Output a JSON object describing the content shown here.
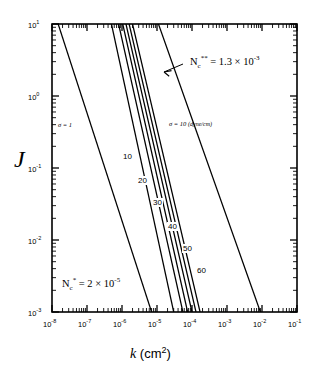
{
  "chart_data": {
    "type": "line",
    "title": "",
    "xlabel": "k  (cm2)",
    "xlabel_symbol": "k",
    "xlabel_unit": "(cm",
    "xlabel_unit_sup": "2",
    "xlabel_unit_end": ")",
    "ylabel": "J",
    "xscale": "log",
    "yscale": "log",
    "xlim": [
      1e-08,
      0.1
    ],
    "ylim": [
      0.001,
      10.0
    ],
    "grid": false,
    "legend": "none",
    "xticks": [
      {
        "value": 1e-08,
        "mantissa": "10",
        "exp": "-8"
      },
      {
        "value": 1e-07,
        "mantissa": "10",
        "exp": "-7"
      },
      {
        "value": 1e-06,
        "mantissa": "10",
        "exp": "-6"
      },
      {
        "value": 1e-05,
        "mantissa": "10",
        "exp": "-5"
      },
      {
        "value": 0.0001,
        "mantissa": "10",
        "exp": "-4"
      },
      {
        "value": 0.001,
        "mantissa": "10",
        "exp": "-3"
      },
      {
        "value": 0.01,
        "mantissa": "10",
        "exp": "-2"
      },
      {
        "value": 0.1,
        "mantissa": "10",
        "exp": "-1"
      }
    ],
    "yticks": [
      {
        "value": 10,
        "mantissa": "10",
        "exp": "1"
      },
      {
        "value": 1,
        "mantissa": "10",
        "exp": "0"
      },
      {
        "value": 0.1,
        "mantissa": "10",
        "exp": "-1"
      },
      {
        "value": 0.01,
        "mantissa": "10",
        "exp": "-2"
      },
      {
        "value": 0.001,
        "mantissa": "10",
        "exp": "-3"
      }
    ],
    "series": [
      {
        "name": "sigma-1",
        "sigma": 1,
        "label": "1",
        "x": [
          1.5e-08,
          7e-06
        ],
        "y": [
          10.0,
          0.001
        ]
      },
      {
        "name": "sigma-10",
        "sigma": 10,
        "label": "10",
        "x": [
          5e-07,
          3e-05
        ],
        "y": [
          10.0,
          0.001
        ]
      },
      {
        "name": "sigma-20",
        "sigma": 20,
        "label": "20",
        "x": [
          8e-07,
          5.5e-05
        ],
        "y": [
          10.0,
          0.001
        ]
      },
      {
        "name": "sigma-30",
        "sigma": 30,
        "label": "30",
        "x": [
          1.05e-06,
          7.5e-05
        ],
        "y": [
          10.0,
          0.001
        ]
      },
      {
        "name": "sigma-40",
        "sigma": 40,
        "label": "40",
        "x": [
          1.3e-06,
          0.0001
        ],
        "y": [
          10.0,
          0.001
        ]
      },
      {
        "name": "sigma-50",
        "sigma": 50,
        "label": "50",
        "x": [
          1.6e-06,
          0.00013
        ],
        "y": [
          10.0,
          0.001
        ]
      },
      {
        "name": "sigma-60",
        "sigma": 60,
        "label": "60",
        "x": [
          2e-06,
          0.00017
        ],
        "y": [
          10.0,
          0.001
        ]
      },
      {
        "name": "sigma-10-dyne-cm",
        "sigma": 10,
        "label": "10 (dyne/cm)",
        "x": [
          1.1e-05,
          0.009
        ],
        "y": [
          10.0,
          0.001
        ]
      }
    ],
    "annotations": [
      {
        "name": "nc-double-star",
        "text": "Nc** = 1.3 × 10-3",
        "prefix": "N",
        "sub": "c",
        "sup_marks": "**",
        "eq": " = 1.3 × 10",
        "exp": "-3",
        "arrow": true
      },
      {
        "name": "nc-star",
        "text": "Nc* = 2 × 10-5",
        "prefix": "N",
        "sub": "c",
        "sup_marks": "*",
        "eq": " = 2 × 10",
        "exp": "-5",
        "arrow": false
      },
      {
        "name": "sigma-left",
        "text": "σ = 1",
        "symbol": "σ",
        "eq": " = ",
        "value": "1",
        "unit": ""
      },
      {
        "name": "sigma-right",
        "text": "σ = 10 (dyne/cm)",
        "symbol": "σ",
        "eq": " = ",
        "value": "10 ",
        "unit": "(dyne/cm)"
      }
    ],
    "curve_labels": [
      "10",
      "20",
      "30",
      "40",
      "50",
      "60"
    ]
  }
}
